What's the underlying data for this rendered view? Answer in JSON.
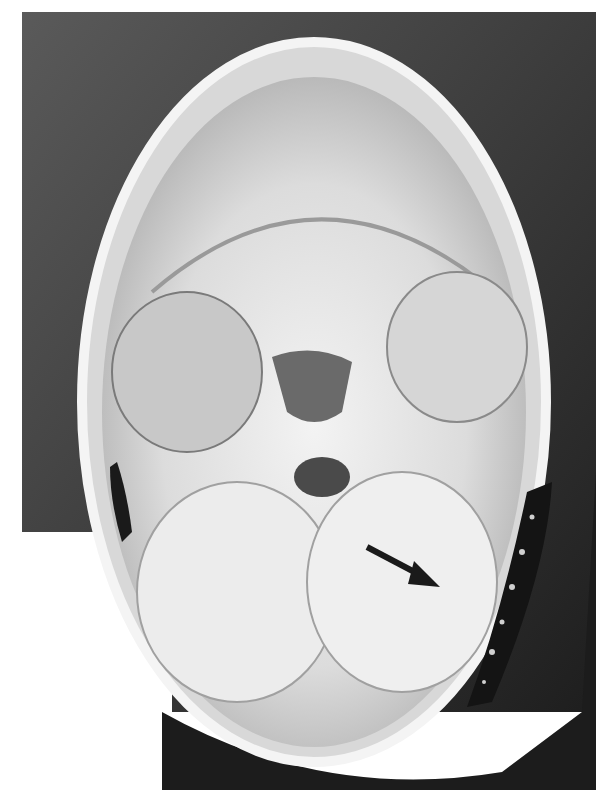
{
  "image": {
    "description": "Grayscale autopsy photograph of the cranial base (skull cap removed) viewed from above, showing cranial fossae with a dark hemorrhage along the right posterior inner wall",
    "annotation": {
      "type": "arrow",
      "icon": "arrow-icon",
      "points_to": "dark blood collection along the posterior fossa wall"
    },
    "colors": {
      "background": "#ffffff",
      "dark_tissue": "#2a2a2a",
      "bone": "#e6e6e6",
      "hemorrhage": "#141414",
      "arrow": "#1a1a1a"
    }
  }
}
